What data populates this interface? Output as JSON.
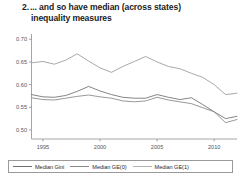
{
  "title": {
    "number": "2.",
    "line1": "... and so have median (across states)",
    "line2": "inequality measures"
  },
  "chart_data": {
    "type": "line",
    "xlabel": "",
    "ylabel": "",
    "xlim": [
      1994,
      2012
    ],
    "ylim": [
      0.48,
      0.705
    ],
    "grid": false,
    "legend_position": "bottom",
    "xticks": [
      1995,
      2000,
      2005,
      2010
    ],
    "xtick_labels": [
      "1995",
      "2000",
      "2005",
      "2010"
    ],
    "yticks": [
      0.5,
      0.55,
      0.6,
      0.65,
      0.7
    ],
    "ytick_labels": [
      "0.50",
      "0.55",
      "0.60",
      "0.65",
      "0.70"
    ],
    "x": [
      1994,
      1995,
      1996,
      1997,
      1998,
      1999,
      2000,
      2001,
      2002,
      2003,
      2004,
      2005,
      2006,
      2007,
      2008,
      2009,
      2010,
      2011,
      2012
    ],
    "series": [
      {
        "name": "Median Gini",
        "color": "#9e9e9e",
        "values": [
          0.648,
          0.651,
          0.645,
          0.654,
          0.668,
          0.652,
          0.637,
          0.627,
          0.64,
          0.651,
          0.662,
          0.65,
          0.64,
          0.635,
          0.625,
          0.616,
          0.6,
          0.578,
          0.581
        ]
      },
      {
        "name": "Median GE(0)",
        "color": "#777777",
        "values": [
          0.578,
          0.573,
          0.572,
          0.576,
          0.585,
          0.596,
          0.586,
          0.578,
          0.572,
          0.57,
          0.57,
          0.578,
          0.572,
          0.567,
          0.571,
          0.556,
          0.54,
          0.525,
          0.53
        ]
      },
      {
        "name": "Median GE(1)",
        "color": "#8c8c8c",
        "values": [
          0.571,
          0.567,
          0.566,
          0.57,
          0.574,
          0.577,
          0.573,
          0.57,
          0.564,
          0.562,
          0.564,
          0.572,
          0.566,
          0.562,
          0.558,
          0.549,
          0.54,
          0.516,
          0.523
        ]
      }
    ]
  },
  "legend": [
    {
      "label": "Median Gini"
    },
    {
      "label": "Median GE(0)"
    },
    {
      "label": "Median GE(1)"
    }
  ]
}
